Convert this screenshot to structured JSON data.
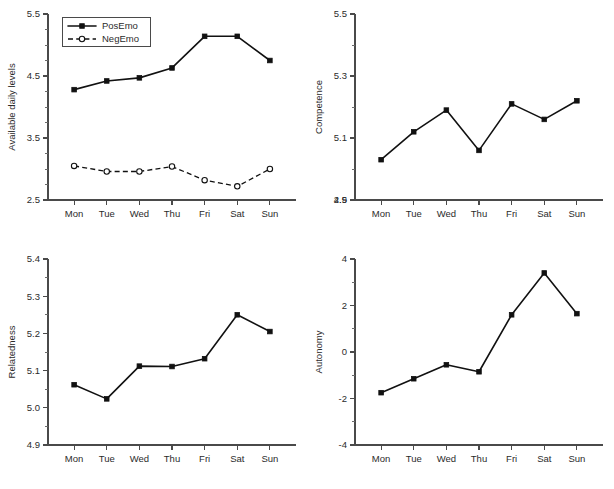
{
  "figure": {
    "layout": "2x2 grid of line panels",
    "background": "#ffffff",
    "line_color": "#111111",
    "axis_color": "#4a4a4a"
  },
  "chart_data": [
    {
      "id": "panel-1",
      "type": "line",
      "title": "",
      "xlabel": "",
      "ylabel": "Available daily levels",
      "categories": [
        "Mon",
        "Tue",
        "Wed",
        "Thu",
        "Fri",
        "Sat",
        "Sun"
      ],
      "ylim": [
        2.5,
        5.5
      ],
      "yticks": [
        2.5,
        3.5,
        4.5,
        5.5
      ],
      "ytick_labels": [
        "2.5",
        "3.5",
        "4.5",
        "5.5"
      ],
      "minor_ticks_per_interval": 4,
      "grid": false,
      "legend_position": "top-left inside",
      "series": [
        {
          "name": "PosEmo",
          "marker": "filled-square",
          "linestyle": "solid",
          "values": [
            4.28,
            4.42,
            4.47,
            4.63,
            5.14,
            5.14,
            4.75
          ]
        },
        {
          "name": "NegEmo",
          "marker": "open-circle",
          "linestyle": "dashed",
          "values": [
            3.05,
            2.96,
            2.96,
            3.04,
            2.82,
            2.72,
            3.0
          ]
        }
      ]
    },
    {
      "id": "panel-2",
      "type": "line",
      "title": "",
      "xlabel": "",
      "ylabel": "Competence",
      "categories": [
        "Mon",
        "Tue",
        "Wed",
        "Thu",
        "Fri",
        "Sat",
        "Sun"
      ],
      "ylim": [
        4.9,
        5.5
      ],
      "yticks": [
        4.9,
        5.1,
        5.3,
        5.5
      ],
      "ytick_labels": [
        "4.9",
        "5.1",
        "5.3",
        "5.5"
      ],
      "axis_break_label": "2.5",
      "minor_ticks_per_interval": 2,
      "grid": false,
      "legend_position": "none",
      "series": [
        {
          "name": "Competence",
          "marker": "filled-square",
          "linestyle": "solid",
          "values": [
            5.03,
            5.12,
            5.19,
            5.06,
            5.21,
            5.16,
            5.22
          ]
        }
      ]
    },
    {
      "id": "panel-3",
      "type": "line",
      "title": "",
      "xlabel": "",
      "ylabel": "Relatedness",
      "categories": [
        "Mon",
        "Tue",
        "Wed",
        "Thu",
        "Fri",
        "Sat",
        "Sun"
      ],
      "ylim": [
        4.9,
        5.4
      ],
      "yticks": [
        4.9,
        5.0,
        5.1,
        5.2,
        5.3,
        5.4
      ],
      "ytick_labels": [
        "4.9",
        "5.0",
        "5.1",
        "5.2",
        "5.3",
        "5.4"
      ],
      "minor_ticks_per_interval": 2,
      "grid": false,
      "legend_position": "none",
      "series": [
        {
          "name": "Relatedness",
          "marker": "filled-square",
          "linestyle": "solid",
          "values": [
            5.062,
            5.024,
            5.112,
            5.111,
            5.132,
            5.25,
            5.205
          ]
        }
      ]
    },
    {
      "id": "panel-4",
      "type": "line",
      "title": "",
      "xlabel": "",
      "ylabel": "Autonomy",
      "categories": [
        "Mon",
        "Tue",
        "Wed",
        "Thu",
        "Fri",
        "Sat",
        "Sun"
      ],
      "ylim": [
        -4,
        4
      ],
      "yticks": [
        -4,
        -2,
        0,
        2,
        4
      ],
      "ytick_labels": [
        "-4",
        "-2",
        "0",
        "2",
        "4"
      ],
      "minor_ticks_per_interval": 2,
      "grid": false,
      "legend_position": "none",
      "series": [
        {
          "name": "Autonomy",
          "marker": "filled-square",
          "linestyle": "solid",
          "values": [
            -1.75,
            -1.15,
            -0.55,
            -0.85,
            1.6,
            3.4,
            1.65
          ]
        }
      ]
    }
  ]
}
